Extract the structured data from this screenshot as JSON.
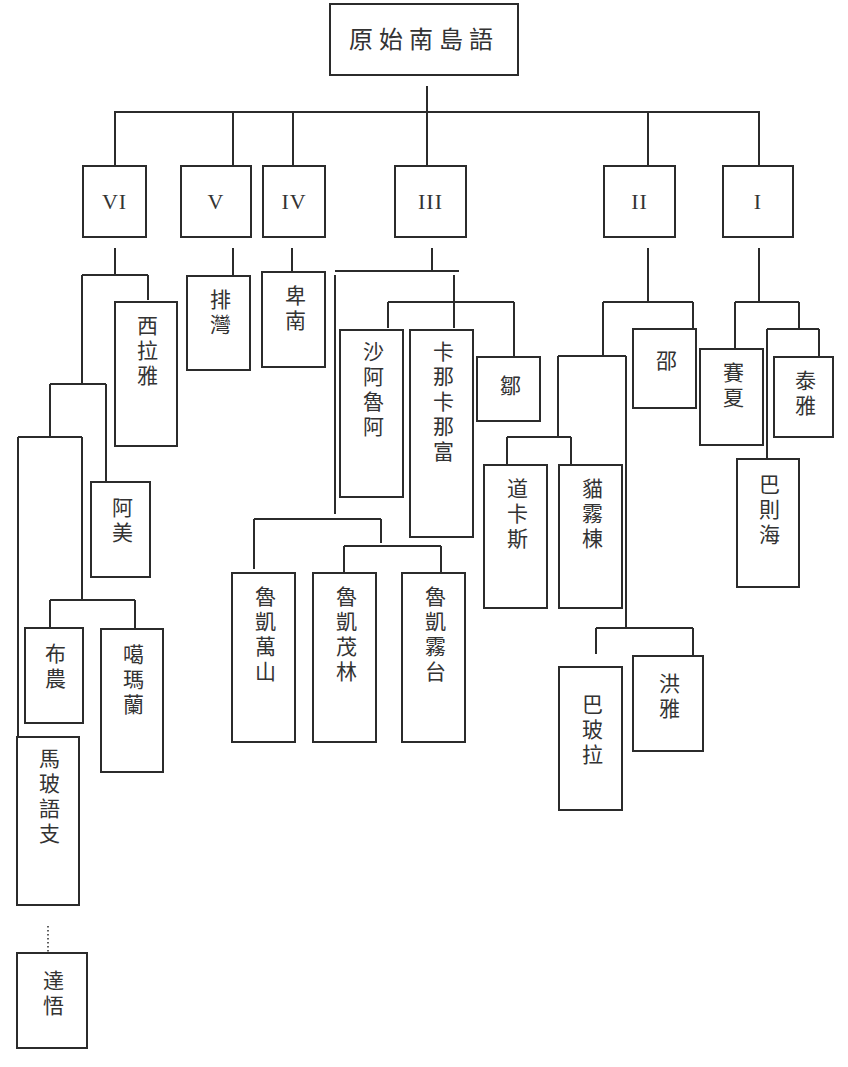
{
  "diagram": {
    "type": "language-family-tree",
    "root": {
      "label": "原始南島語"
    },
    "branches": [
      {
        "id": "VI",
        "label": "VI"
      },
      {
        "id": "V",
        "label": "V"
      },
      {
        "id": "IV",
        "label": "IV"
      },
      {
        "id": "III",
        "label": "III"
      },
      {
        "id": "II",
        "label": "II"
      },
      {
        "id": "I",
        "label": "I"
      }
    ],
    "languages": {
      "siraya": "西拉雅",
      "amis": "阿美",
      "bunun": "布農",
      "kanakanavu": "噶瑪蘭",
      "mapo": "馬玻語支",
      "tao": "達悟",
      "paiwan": "排灣",
      "puyuma": "卑南",
      "saaroa": "沙阿魯阿",
      "kanakanabu": "卡那卡那富",
      "tsou": "鄒",
      "rukai_wanshan": "魯凱萬山",
      "rukai_maolin": "魯凱茂林",
      "rukai_wutai": "魯凱霧台",
      "taokas": "道卡斯",
      "babuza_mawuludong": "貓霧棟",
      "thao": "邵",
      "papora": "巴玻拉",
      "hoanya": "洪雅",
      "saisiyat": "賽夏",
      "atayal": "泰雅",
      "pazeh": "巴則海"
    },
    "edges": [
      [
        "原始南島語",
        "VI"
      ],
      [
        "原始南島語",
        "V"
      ],
      [
        "原始南島語",
        "IV"
      ],
      [
        "原始南島語",
        "III"
      ],
      [
        "原始南島語",
        "II"
      ],
      [
        "原始南島語",
        "I"
      ],
      [
        "VI",
        "西拉雅"
      ],
      [
        "VI",
        "阿美"
      ],
      [
        "VI",
        "布農"
      ],
      [
        "VI",
        "噶瑪蘭"
      ],
      [
        "VI",
        "馬玻語支"
      ],
      [
        "馬玻語支",
        "達悟",
        "dotted"
      ],
      [
        "V",
        "排灣"
      ],
      [
        "IV",
        "卑南"
      ],
      [
        "III",
        "沙阿魯阿"
      ],
      [
        "III",
        "卡那卡那富"
      ],
      [
        "III",
        "鄒"
      ],
      [
        "III",
        "魯凱萬山"
      ],
      [
        "III",
        "魯凱茂林"
      ],
      [
        "III",
        "魯凱霧台"
      ],
      [
        "II",
        "邵"
      ],
      [
        "II",
        "道卡斯"
      ],
      [
        "II",
        "貓霧棟"
      ],
      [
        "II",
        "巴玻拉"
      ],
      [
        "II",
        "洪雅"
      ],
      [
        "I",
        "賽夏"
      ],
      [
        "I",
        "泰雅"
      ],
      [
        "I",
        "巴則海"
      ]
    ]
  }
}
